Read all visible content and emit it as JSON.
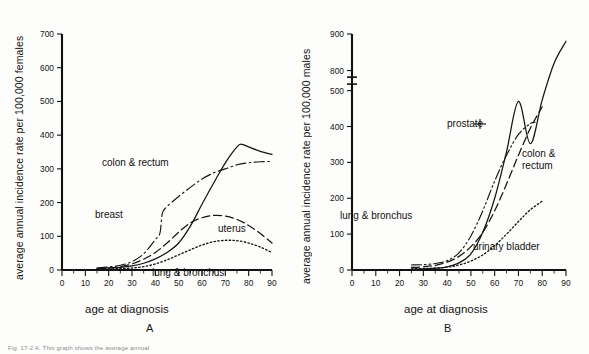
{
  "figure": {
    "panel_a_letter": "A",
    "panel_b_letter": "B",
    "caption": "Fig. 17-2    A. This graph shows the average annual"
  },
  "panel_a": {
    "ylabel": "average annual incidence rate per 100,000 females",
    "xlabel": "age at diagnosis",
    "y_ticks": [
      "0",
      "100",
      "200",
      "300",
      "400",
      "500",
      "600",
      "700"
    ],
    "x_ticks": [
      "0",
      "10",
      "20",
      "30",
      "40",
      "50",
      "60",
      "70",
      "80",
      "90"
    ],
    "curve_labels": {
      "colon_rectum": "colon & rectum",
      "breast": "breast",
      "uterus": "uterus",
      "lung_bronchus": "lung & bronchus"
    }
  },
  "panel_b": {
    "ylabel": "average annual incidence rate per 100,000 males",
    "xlabel": "age at diagnosis",
    "y_ticks": [
      "0",
      "100",
      "200",
      "300",
      "400",
      "500",
      "800",
      "900"
    ],
    "x_ticks": [
      "0",
      "10",
      "20",
      "30",
      "40",
      "50",
      "60",
      "70",
      "80",
      "90"
    ],
    "curve_labels": {
      "prostate": "prostate",
      "colon_rectum_line1": "colon &",
      "colon_rectum_line2": "rectum",
      "lung_bronchus": "lung & bronchus",
      "urinary_bladder": "urinary bladder"
    }
  },
  "chart_data": [
    {
      "type": "line",
      "panel": "A",
      "title": "",
      "xlabel": "age at diagnosis",
      "ylabel": "average annual incidence rate per 100,000 females",
      "xlim": [
        0,
        90
      ],
      "ylim": [
        0,
        700
      ],
      "xticks": [
        0,
        10,
        20,
        30,
        40,
        50,
        60,
        70,
        80,
        90
      ],
      "yticks": [
        0,
        100,
        200,
        300,
        400,
        500,
        600,
        700
      ],
      "grid": false,
      "legend": "inline-labels",
      "series": [
        {
          "name": "colon & rectum",
          "style": "solid",
          "x": [
            15,
            20,
            25,
            30,
            35,
            40,
            45,
            50,
            55,
            60,
            65,
            70,
            75,
            77,
            80,
            85,
            90
          ],
          "y": [
            5,
            6,
            8,
            12,
            20,
            33,
            52,
            80,
            130,
            195,
            258,
            318,
            365,
            373,
            365,
            352,
            343
          ]
        },
        {
          "name": "breast",
          "style": "dash-dot",
          "x": [
            15,
            20,
            25,
            30,
            35,
            40,
            42,
            43,
            45,
            50,
            55,
            60,
            65,
            70,
            75,
            80,
            85,
            90
          ],
          "y": [
            6,
            9,
            14,
            25,
            48,
            90,
            110,
            168,
            188,
            218,
            245,
            270,
            288,
            300,
            312,
            318,
            321,
            322
          ]
        },
        {
          "name": "uterus",
          "style": "dashed",
          "x": [
            15,
            20,
            25,
            30,
            35,
            40,
            45,
            50,
            55,
            60,
            65,
            70,
            75,
            80,
            85,
            90
          ],
          "y": [
            4,
            6,
            10,
            18,
            32,
            52,
            80,
            112,
            140,
            155,
            162,
            160,
            150,
            132,
            108,
            80
          ]
        },
        {
          "name": "lung & bronchus",
          "style": "dotted",
          "x": [
            15,
            20,
            25,
            30,
            35,
            40,
            45,
            50,
            55,
            60,
            65,
            70,
            75,
            80,
            85,
            90
          ],
          "y": [
            2,
            3,
            4,
            6,
            10,
            18,
            30,
            45,
            60,
            74,
            84,
            88,
            87,
            80,
            68,
            52
          ]
        }
      ]
    },
    {
      "type": "line",
      "panel": "B",
      "title": "",
      "xlabel": "age at diagnosis",
      "ylabel": "average annual incidence rate per 100,000 males",
      "xlim": [
        0,
        90
      ],
      "ylim": [
        0,
        900
      ],
      "y_axis_break": [
        500,
        800
      ],
      "xticks": [
        0,
        10,
        20,
        30,
        40,
        50,
        60,
        70,
        80,
        90
      ],
      "yticks": [
        0,
        100,
        200,
        300,
        400,
        500,
        800,
        900
      ],
      "grid": false,
      "legend": "inline-labels",
      "series": [
        {
          "name": "prostate",
          "style": "solid",
          "x": [
            25,
            30,
            35,
            40,
            45,
            50,
            55,
            60,
            65,
            70,
            75,
            80,
            85,
            90
          ],
          "y": [
            2,
            3,
            5,
            9,
            20,
            45,
            105,
            200,
            330,
            470,
            600,
            720,
            820,
            880
          ]
        },
        {
          "name": "colon & rectum",
          "style": "dashed",
          "x": [
            25,
            30,
            35,
            40,
            45,
            50,
            55,
            60,
            65,
            70,
            75,
            80,
            84,
            87,
            90
          ],
          "y": [
            7,
            9,
            13,
            22,
            38,
            65,
            105,
            165,
            240,
            320,
            395,
            455,
            500,
            370,
            205
          ]
        },
        {
          "name": "lung & bronchus",
          "style": "dash-dot-dot",
          "x": [
            25,
            30,
            35,
            40,
            45,
            50,
            55,
            60,
            65,
            70,
            75,
            77,
            80,
            85,
            90
          ],
          "y": [
            14,
            15,
            18,
            26,
            48,
            95,
            165,
            248,
            320,
            378,
            408,
            412,
            360,
            270,
            180
          ]
        },
        {
          "name": "urinary bladder",
          "style": "dotted",
          "x": [
            25,
            30,
            35,
            40,
            45,
            50,
            55,
            60,
            65,
            70,
            75,
            80,
            84,
            87,
            90
          ],
          "y": [
            3,
            4,
            5,
            8,
            14,
            25,
            42,
            68,
            100,
            135,
            168,
            192,
            205,
            180,
            163
          ]
        }
      ]
    }
  ]
}
